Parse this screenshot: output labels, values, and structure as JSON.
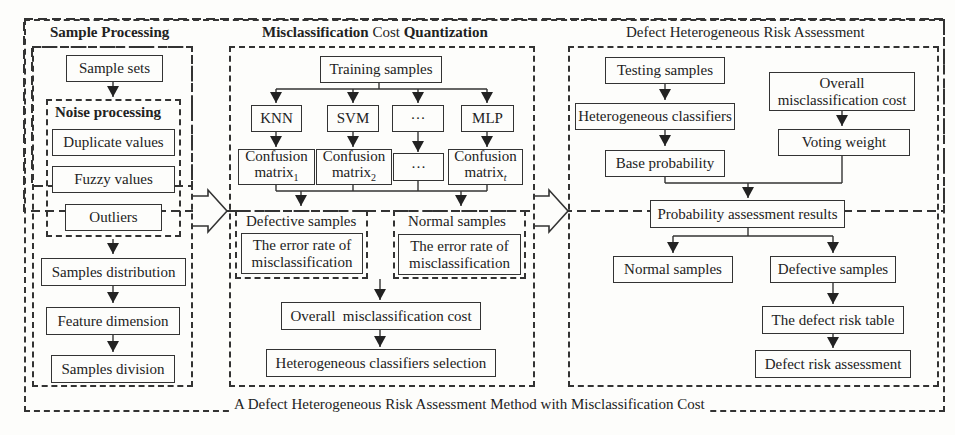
{
  "outer": {
    "caption": "A Defect Heterogeneous Risk Assessment Method with Misclassification Cost"
  },
  "sample_processing": {
    "title": "Sample Processing",
    "sample_sets": "Sample sets",
    "noise_processing": {
      "title": "Noise processing",
      "items": [
        "Duplicate values",
        "Fuzzy values",
        "Outliers"
      ]
    },
    "samples_distribution": "Samples distribution",
    "feature_dimension": "Feature dimension",
    "samples_division": "Samples division"
  },
  "misclassification": {
    "title_part1": "Misclassification",
    "title_part2": "Cost",
    "title_part3": "Quantization",
    "training_samples": "Training samples",
    "classifiers": [
      "KNN",
      "SVM",
      "···",
      "MLP"
    ],
    "confusion_label": "Confusion",
    "matrix_label": "matrix",
    "matrix_subs": [
      "1",
      "2",
      "",
      "t"
    ],
    "ellipsis": "···",
    "defective_group": {
      "title": "Defective samples",
      "line1": "The error rate of",
      "line2": "misclassification"
    },
    "normal_group": {
      "title": "Normal samples",
      "line1": "The error rate of",
      "line2": "misclassification"
    },
    "overall_cost": "Overall  misclassification cost",
    "classifier_selection": "Heterogeneous classifiers selection"
  },
  "risk_assessment": {
    "title": "Defect Heterogeneous Risk Assessment",
    "testing_samples": "Testing samples",
    "heterogeneous_classifiers": "Heterogeneous classifiers",
    "base_probability": "Base probability",
    "overall_cost_line1": "Overall",
    "overall_cost_line2": "misclassification cost",
    "voting_weight": "Voting weight",
    "probability_results": "Probability assessment results",
    "normal_samples": "Normal samples",
    "defective_samples": "Defective samples",
    "defect_risk_table": "The defect risk table",
    "defect_risk_assessment": "Defect risk assessment"
  }
}
